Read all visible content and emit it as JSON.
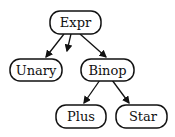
{
  "diagram": {
    "type": "tree",
    "nodes": [
      {
        "id": "expr",
        "label": "Expr"
      },
      {
        "id": "unary",
        "label": "Unary"
      },
      {
        "id": "binop",
        "label": "Binop"
      },
      {
        "id": "plus",
        "label": "Plus"
      },
      {
        "id": "star",
        "label": "Star"
      }
    ],
    "edges": [
      {
        "from": "expr",
        "to": "unary"
      },
      {
        "from": "expr",
        "to": "(elided)"
      },
      {
        "from": "expr",
        "to": "binop"
      },
      {
        "from": "binop",
        "to": "plus"
      },
      {
        "from": "binop",
        "to": "star"
      }
    ]
  }
}
